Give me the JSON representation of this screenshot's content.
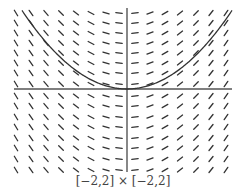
{
  "figure": {
    "type": "slope-field",
    "equation": "dy/dx = x",
    "caption": "[−2,2] × [−2,2]",
    "window": {
      "xmin": -2,
      "xmax": 2,
      "ymin": -2,
      "ymax": 2
    },
    "colors": {
      "ink": "#333333",
      "axis": "#555555",
      "background": "#ffffff"
    },
    "grid": {
      "columns_px": [
        16,
        31,
        46,
        61,
        76,
        91,
        106,
        119,
        135,
        150,
        165,
        180,
        196,
        211,
        226
      ],
      "rows_px": [
        13,
        23,
        33,
        43,
        53,
        63,
        73,
        84,
        96,
        106,
        117,
        127,
        138,
        148,
        159,
        170
      ]
    },
    "axes": {
      "x_axis_y_px": 89,
      "y_axis_x_px": 127,
      "x_start_px": 14,
      "x_end_px": 232,
      "y_start_px": 8,
      "y_end_px": 172
    },
    "solution_curve": {
      "label": "particular solution y = x²/2",
      "vertex_px": [
        127,
        89
      ]
    }
  }
}
